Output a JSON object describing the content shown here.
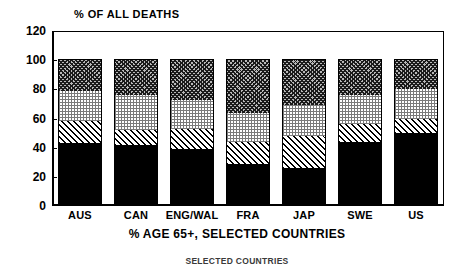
{
  "chart_data": {
    "type": "bar",
    "subtype": "stacked-bar",
    "title": "",
    "ylabel": "% OF ALL DEATHS",
    "xlabel": "% AGE 65+, SELECTED COUNTRIES",
    "caption": "SELECTED COUNTRIES",
    "categories": [
      "AUS",
      "CAN",
      "ENG/WAL",
      "FRA",
      "JAP",
      "SWE",
      "US"
    ],
    "ylim": [
      0,
      120
    ],
    "yticks": [
      0,
      20,
      40,
      60,
      80,
      100,
      120
    ],
    "ytick_labels": [
      "0",
      "20",
      "40",
      "60",
      "80",
      "100",
      "120"
    ],
    "grid": false,
    "legend": "none",
    "stack_total": 100,
    "series": [
      {
        "name": "segment-1",
        "pattern": "solid-black",
        "color": "#000000",
        "values": [
          43,
          42,
          39,
          29,
          26,
          44,
          50
        ]
      },
      {
        "name": "segment-2",
        "pattern": "diagonal-hatch",
        "color": "#ffffff",
        "values": [
          15,
          10,
          14,
          15,
          22,
          12,
          10
        ]
      },
      {
        "name": "segment-3",
        "pattern": "fine-dot",
        "color": "#efefef",
        "values": [
          21,
          24,
          20,
          20,
          21,
          20,
          20
        ]
      },
      {
        "name": "segment-4",
        "pattern": "cross-hatch",
        "color": "#9a9a9a",
        "values": [
          21,
          24,
          27,
          36,
          31,
          24,
          20
        ]
      }
    ],
    "cumulative_tops": [
      [
        43,
        58,
        79,
        100
      ],
      [
        42,
        52,
        76,
        100
      ],
      [
        39,
        53,
        73,
        100
      ],
      [
        29,
        44,
        64,
        100
      ],
      [
        26,
        48,
        69,
        100
      ],
      [
        44,
        56,
        76,
        100
      ],
      [
        50,
        60,
        80,
        100
      ]
    ]
  }
}
